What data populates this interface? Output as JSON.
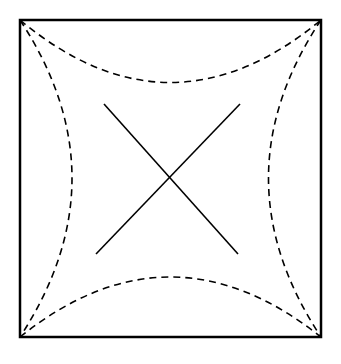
{
  "diagram": {
    "title": "",
    "background": "#ffffff",
    "stroke_color": "#000000",
    "frame": {
      "x1": 20,
      "y1": 20,
      "x2": 321,
      "y2": 337,
      "stroke_width": 2.5
    },
    "dashed_arcs": [
      {
        "name": "top-arc",
        "from": [
          20,
          20
        ],
        "to": [
          321,
          20
        ],
        "control": [
          170,
          145
        ],
        "dash": "7,5"
      },
      {
        "name": "bottom-arc",
        "from": [
          20,
          337
        ],
        "to": [
          321,
          337
        ],
        "control": [
          170,
          217
        ],
        "dash": "7,5"
      },
      {
        "name": "left-arc",
        "from": [
          20,
          20
        ],
        "to": [
          20,
          337
        ],
        "control": [
          124,
          178
        ],
        "dash": "7,5"
      },
      {
        "name": "right-arc",
        "from": [
          321,
          20
        ],
        "to": [
          321,
          337
        ],
        "control": [
          216,
          178
        ],
        "dash": "7,5"
      }
    ],
    "diagonals": [
      {
        "name": "diagonal-descending",
        "from": [
          104,
          104
        ],
        "to": [
          238,
          254
        ]
      },
      {
        "name": "diagonal-ascending",
        "from": [
          240,
          104
        ],
        "to": [
          96,
          254
        ]
      }
    ]
  }
}
